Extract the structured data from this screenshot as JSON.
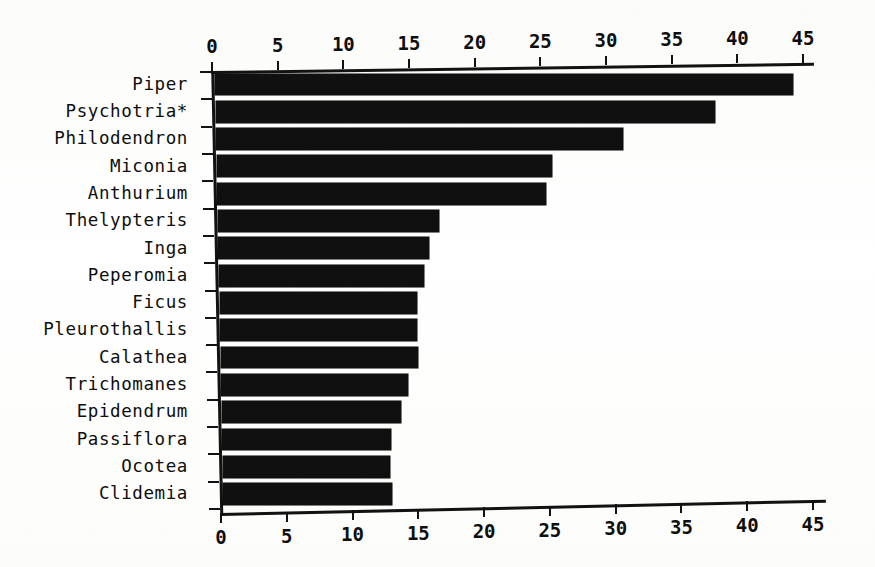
{
  "chart_data": {
    "type": "bar",
    "orientation": "horizontal",
    "title": "",
    "xlabel": "",
    "ylabel": "",
    "categories": [
      "Piper",
      "Psychotria*",
      "Philodendron",
      "Miconia",
      "Anthurium",
      "Thelypteris",
      "Inga",
      "Peperomia",
      "Ficus",
      "Pleurothallis",
      "Calathea",
      "Trichomanes",
      "Epidendrum",
      "Passiflora",
      "Ocotea",
      "Clidemia"
    ],
    "values": [
      44,
      38,
      31,
      25.5,
      25,
      16.8,
      16,
      15.6,
      15,
      15,
      15,
      14.2,
      13.6,
      12.8,
      12.7,
      12.8
    ],
    "xlim": [
      0,
      45
    ],
    "xticks": [
      0,
      5,
      10,
      15,
      20,
      25,
      30,
      35,
      40,
      45
    ],
    "xtick_labels": [
      "0",
      "5",
      "10",
      "15",
      "20",
      "25",
      "30",
      "35",
      "40",
      "45"
    ],
    "grid": false,
    "legend": null,
    "bar_color": "#101010",
    "axis_color": "#121212",
    "axes_shown": [
      "top",
      "bottom",
      "left"
    ]
  },
  "caption": {
    "ghost_text": ""
  }
}
